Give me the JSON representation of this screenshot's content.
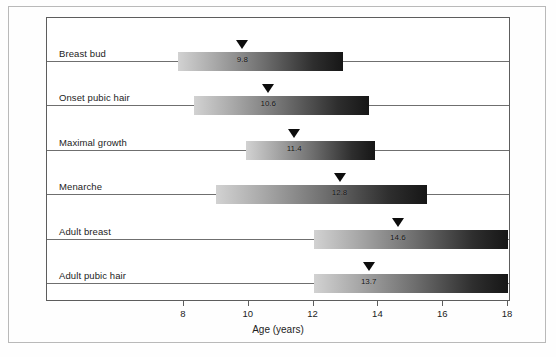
{
  "chart_data": {
    "type": "bar",
    "title": "",
    "xlabel": "Age (years)",
    "ylabel": "",
    "xlim": [
      6.8,
      18.0
    ],
    "xticks": [
      8,
      10,
      12,
      14,
      16,
      18
    ],
    "xtick_labels": [
      "8",
      "10",
      "12",
      "14",
      "16",
      "18"
    ],
    "grid": true,
    "legend": "none",
    "orientation": "horizontal",
    "note": "Range bars with mean marker (triangle) and mean value label",
    "categories": [
      "Breast bud",
      "Onset pubic hair",
      "Maximal growth",
      "Menarche",
      "Adult breast",
      "Adult pubic hair"
    ],
    "series": [
      {
        "name": "Age range",
        "bars": [
          {
            "label": "Breast bud",
            "start": 7.8,
            "end": 12.9,
            "mean": 9.8,
            "mean_label": "9.8"
          },
          {
            "label": "Onset pubic hair",
            "start": 8.3,
            "end": 13.7,
            "mean": 10.6,
            "mean_label": "10.6"
          },
          {
            "label": "Maximal growth",
            "start": 9.9,
            "end": 13.9,
            "mean": 11.4,
            "mean_label": "11.4"
          },
          {
            "label": "Menarche",
            "start": 9.0,
            "end": 15.5,
            "mean": 12.8,
            "mean_label": "12.8"
          },
          {
            "label": "Adult breast",
            "start": 12.0,
            "end": 18.0,
            "mean": 14.6,
            "mean_label": "14.6"
          },
          {
            "label": "Adult pubic hair",
            "start": 12.0,
            "end": 18.0,
            "mean": 13.7,
            "mean_label": "13.7"
          }
        ]
      }
    ],
    "values": [
      9.8,
      10.6,
      11.4,
      12.8,
      14.6,
      13.7
    ]
  },
  "axis": {
    "x_title": "Age (years)",
    "ticks": [
      "8",
      "10",
      "12",
      "14",
      "16",
      "18"
    ]
  },
  "rows": [
    {
      "label": "Breast bud",
      "mean_label": "9.8"
    },
    {
      "label": "Onset pubic hair",
      "mean_label": "10.6"
    },
    {
      "label": "Maximal growth",
      "mean_label": "11.4"
    },
    {
      "label": "Menarche",
      "mean_label": "12.8"
    },
    {
      "label": "Adult breast",
      "mean_label": "14.6"
    },
    {
      "label": "Adult pubic hair",
      "mean_label": "13.7"
    }
  ],
  "colors": {
    "frame": "#5d5d5d",
    "gridline": "#6f6f6f",
    "bar_light": "#d2d2d2",
    "bar_dark": "#161616",
    "marker": "#0d0d0d",
    "text": "#1c1c1c",
    "page_border": "#b9b9b9",
    "background": "#ffffff"
  }
}
